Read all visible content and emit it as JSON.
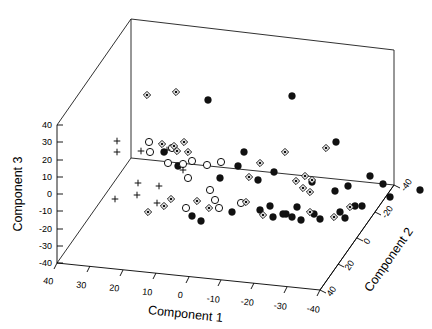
{
  "figure": {
    "background": "#ffffff",
    "foreground": "#000000",
    "width": 432,
    "height": 329
  },
  "chart_data": {
    "type": "scatter",
    "projection": "3d",
    "title": "",
    "subtitle": "",
    "xlabel": "Component 1",
    "ylabel": "Component 2",
    "zlabel": "Component 3",
    "grid": false,
    "legend": null,
    "legend_position": "none",
    "xlim": [
      -40,
      40
    ],
    "ylim": [
      -40,
      40
    ],
    "zlim": [
      -40,
      40
    ],
    "x_axis_reversed": true,
    "y_axis_reversed": true,
    "xticks": [
      40,
      30,
      20,
      10,
      0,
      -10,
      -20,
      -30,
      -40
    ],
    "xticklabels": [
      "40",
      "30",
      "20",
      "10",
      "0",
      "-10",
      "-20",
      "-30",
      "-40"
    ],
    "yticks": [
      -40,
      -20,
      0,
      20,
      40
    ],
    "yticklabels": [
      "-40",
      "-20",
      "0",
      "20",
      "40"
    ],
    "zticks": [
      40,
      30,
      20,
      10,
      0,
      -10,
      -20,
      -30,
      -40
    ],
    "zticklabels": [
      "40",
      "30",
      "20",
      "10",
      "0",
      "-10",
      "-20",
      "-30",
      "-40"
    ],
    "marker_colors": {
      "filled_circle": "#111111",
      "open_circle": "#111111",
      "diamond": "#111111",
      "plus": "#111111"
    },
    "series": [
      {
        "name": "filled-circle-group",
        "marker": "filled_circle",
        "count": 34,
        "points": [
          {
            "px": 208,
            "py": 100
          },
          {
            "px": 292,
            "py": 96
          },
          {
            "px": 164,
            "py": 152
          },
          {
            "px": 244,
            "py": 152
          },
          {
            "px": 178,
            "py": 166
          },
          {
            "px": 336,
            "py": 142
          },
          {
            "px": 220,
            "py": 178
          },
          {
            "px": 274,
            "py": 172
          },
          {
            "px": 370,
            "py": 176
          },
          {
            "px": 383,
            "py": 184
          },
          {
            "px": 238,
            "py": 166
          },
          {
            "px": 335,
            "py": 191
          },
          {
            "px": 348,
            "py": 186
          },
          {
            "px": 258,
            "py": 180
          },
          {
            "px": 312,
            "py": 182
          },
          {
            "px": 270,
            "py": 206
          },
          {
            "px": 297,
            "py": 207
          },
          {
            "px": 355,
            "py": 206
          },
          {
            "px": 390,
            "py": 197
          },
          {
            "px": 420,
            "py": 190
          },
          {
            "px": 260,
            "py": 210
          },
          {
            "px": 286,
            "py": 214
          },
          {
            "px": 314,
            "py": 214
          },
          {
            "px": 192,
            "py": 216
          },
          {
            "px": 201,
            "py": 221
          },
          {
            "px": 232,
            "py": 212
          },
          {
            "px": 340,
            "py": 212
          },
          {
            "px": 362,
            "py": 206
          },
          {
            "px": 301,
            "py": 220
          },
          {
            "px": 320,
            "py": 219
          },
          {
            "px": 283,
            "py": 214
          },
          {
            "px": 292,
            "py": 217
          },
          {
            "px": 345,
            "py": 218
          },
          {
            "px": 273,
            "py": 217
          }
        ]
      },
      {
        "name": "open-circle-group",
        "marker": "open_circle",
        "count": 14,
        "points": [
          {
            "px": 149,
            "py": 142
          },
          {
            "px": 150,
            "py": 152
          },
          {
            "px": 172,
            "py": 148
          },
          {
            "px": 168,
            "py": 163
          },
          {
            "px": 183,
            "py": 164
          },
          {
            "px": 207,
            "py": 165
          },
          {
            "px": 192,
            "py": 161
          },
          {
            "px": 221,
            "py": 162
          },
          {
            "px": 188,
            "py": 178
          },
          {
            "px": 210,
            "py": 190
          },
          {
            "px": 215,
            "py": 200
          },
          {
            "px": 219,
            "py": 208
          },
          {
            "px": 186,
            "py": 208
          },
          {
            "px": 241,
            "py": 203
          }
        ]
      },
      {
        "name": "diamond-group",
        "marker": "diamond",
        "count": 26,
        "points": [
          {
            "px": 147,
            "py": 95
          },
          {
            "px": 176,
            "py": 92
          },
          {
            "px": 162,
            "py": 144
          },
          {
            "px": 174,
            "py": 146
          },
          {
            "px": 184,
            "py": 142
          },
          {
            "px": 177,
            "py": 151
          },
          {
            "px": 188,
            "py": 152
          },
          {
            "px": 285,
            "py": 152
          },
          {
            "px": 260,
            "py": 163
          },
          {
            "px": 249,
            "py": 177
          },
          {
            "px": 326,
            "py": 148
          },
          {
            "px": 296,
            "py": 181
          },
          {
            "px": 305,
            "py": 176
          },
          {
            "px": 312,
            "py": 180
          },
          {
            "px": 303,
            "py": 188
          },
          {
            "px": 310,
            "py": 192
          },
          {
            "px": 246,
            "py": 202
          },
          {
            "px": 171,
            "py": 199
          },
          {
            "px": 197,
            "py": 201
          },
          {
            "px": 148,
            "py": 212
          },
          {
            "px": 164,
            "py": 206
          },
          {
            "px": 209,
            "py": 208
          },
          {
            "px": 263,
            "py": 215
          },
          {
            "px": 350,
            "py": 207
          },
          {
            "px": 334,
            "py": 217
          },
          {
            "px": 310,
            "py": 212
          }
        ]
      },
      {
        "name": "plus-group",
        "marker": "plus",
        "count": 10,
        "points": [
          {
            "px": 117,
            "py": 141
          },
          {
            "px": 117,
            "py": 152
          },
          {
            "px": 141,
            "py": 151
          },
          {
            "px": 167,
            "py": 150
          },
          {
            "px": 138,
            "py": 183
          },
          {
            "px": 115,
            "py": 199
          },
          {
            "px": 137,
            "py": 195
          },
          {
            "px": 157,
            "py": 203
          },
          {
            "px": 159,
            "py": 186
          },
          {
            "px": 183,
            "py": 170
          }
        ]
      }
    ]
  },
  "axes": {
    "component1": {
      "label": "Component 1",
      "ticks": [
        "40",
        "30",
        "20",
        "10",
        "0",
        "-10",
        "-20",
        "-30",
        "-40"
      ]
    },
    "component2": {
      "label": "Component 2",
      "ticks": [
        "-40",
        "-20",
        "0",
        "20",
        "40"
      ]
    },
    "component3": {
      "label": "Component 3",
      "ticks": [
        "40",
        "30",
        "20",
        "10",
        "0",
        "-10",
        "-20",
        "-30",
        "-40"
      ]
    }
  }
}
